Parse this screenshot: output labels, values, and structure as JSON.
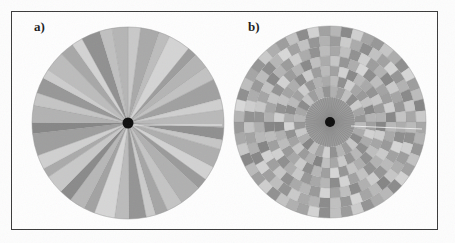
{
  "figure": {
    "background_color": "#fdfdfd",
    "frame_color": "#3a3a3a",
    "width": 455,
    "height": 243
  },
  "panels": [
    {
      "id": "panel-a",
      "label": "a)",
      "label_x": 34,
      "label_y": 19,
      "center_x": 128,
      "center_y": 123,
      "radius": 96,
      "hub_radius": 5.5,
      "hub_color": "#0d0d0d"
    },
    {
      "id": "panel-b",
      "label": "b)",
      "label_x": 248,
      "label_y": 19,
      "center_x": 330,
      "center_y": 122,
      "radius": 96,
      "hub_radius": 5,
      "hub_color": "#0d0d0d",
      "inner_disc_radius": 25,
      "inner_disc_color": "#9b9b9b",
      "inner_spoke_color": "#7d7d7d",
      "inner_spoke_count": 64
    }
  ],
  "palette": {
    "lightest": "#d8d8d8",
    "light": "#c6c6c6",
    "mid_light": "#b6b6b6",
    "mid": "#a8a8a8",
    "mid_dark": "#9a9a9a",
    "dark": "#8d8d8d",
    "darkest": "#7f7f7f",
    "separator": "#8a8a8a",
    "white_streak": "#f2f2f2"
  },
  "chart_data": {
    "type": "pie",
    "title": "",
    "subtitle": "",
    "xlabel": "",
    "ylabel": "",
    "legend": [],
    "grid": false,
    "panel_a": {
      "type": "pie",
      "description": "Unsupervised radial partition: full disc divided into 40 angular sectors of unequal width, each filled with a grayscale value.",
      "sector_count": 40,
      "start_angle_deg": -90,
      "categories": [
        "s1",
        "s2",
        "s3",
        "s4",
        "s5",
        "s6",
        "s7",
        "s8",
        "s9",
        "s10",
        "s11",
        "s12",
        "s13",
        "s14",
        "s15",
        "s16",
        "s17",
        "s18",
        "s19",
        "s20",
        "s21",
        "s22",
        "s23",
        "s24",
        "s25",
        "s26",
        "s27",
        "s28",
        "s29",
        "s30",
        "s31",
        "s32",
        "s33",
        "s34",
        "s35",
        "s36",
        "s37",
        "s38",
        "s39",
        "s40"
      ],
      "values": [
        8,
        12,
        7,
        14,
        6,
        10,
        9,
        13,
        7,
        11,
        8,
        6,
        12,
        9,
        7,
        14,
        10,
        8,
        6,
        11,
        9,
        13,
        7,
        10,
        8,
        12,
        6,
        9,
        14,
        7,
        11,
        8,
        10,
        6,
        13,
        9,
        7,
        12,
        8,
        10
      ],
      "colors": [
        "#c9c9c9",
        "#a9a9a9",
        "#bdbdbd",
        "#d4d4d4",
        "#9d9d9d",
        "#b4b4b4",
        "#c2c2c2",
        "#a0a0a0",
        "#cfcfcf",
        "#b9b9b9",
        "#8f8f8f",
        "#c6c6c6",
        "#aeaeae",
        "#d2d2d2",
        "#9a9a9a",
        "#b0b0b0",
        "#c4c4c4",
        "#a5a5a5",
        "#cbcbcb",
        "#949494",
        "#bbbbbb",
        "#d6d6d6",
        "#a2a2a2",
        "#b7b7b7",
        "#8a8a8a",
        "#c8c8c8",
        "#aaaaaa",
        "#d0d0d0",
        "#9e9e9e",
        "#868686",
        "#b2b2b2",
        "#c5c5c5",
        "#979797",
        "#cdcdcd",
        "#bcbcbc",
        "#a7a7a7",
        "#d3d3d3",
        "#909090",
        "#c0c0c0",
        "#b5b5b5"
      ]
    },
    "panel_b": {
      "type": "heatmap",
      "description": "Polar heatmap: dark uniform inner disc of fine radial spokes surrounded by 7 concentric rings, each ring divided into angular cells with grayscale fills.",
      "ring_count": 7,
      "ring_radii": [
        25,
        36,
        46,
        56,
        66,
        76,
        86,
        96
      ],
      "sectors_per_ring": [
        28,
        32,
        36,
        40,
        44,
        48,
        52
      ],
      "start_angle_deg": -90,
      "ring_values": [
        [
          0.52,
          0.61,
          0.44,
          0.7,
          0.38,
          0.58,
          0.66,
          0.47,
          0.55,
          0.72,
          0.41,
          0.63,
          0.5,
          0.68,
          0.36,
          0.59,
          0.45,
          0.74,
          0.53,
          0.4,
          0.65,
          0.49,
          0.57,
          0.71,
          0.43,
          0.62,
          0.51,
          0.67
        ],
        [
          0.46,
          0.69,
          0.37,
          0.58,
          0.64,
          0.42,
          0.73,
          0.5,
          0.61,
          0.35,
          0.55,
          0.7,
          0.48,
          0.66,
          0.39,
          0.57,
          0.44,
          0.75,
          0.52,
          0.63,
          0.41,
          0.59,
          0.68,
          0.34,
          0.54,
          0.71,
          0.47,
          0.6,
          0.38,
          0.65,
          0.51,
          0.56
        ],
        [
          0.6,
          0.35,
          0.72,
          0.48,
          0.56,
          0.67,
          0.4,
          0.63,
          0.51,
          0.74,
          0.37,
          0.58,
          0.45,
          0.69,
          0.53,
          0.42,
          0.66,
          0.33,
          0.61,
          0.49,
          0.7,
          0.39,
          0.57,
          0.64,
          0.46,
          0.52,
          0.75,
          0.36,
          0.68,
          0.43,
          0.59,
          0.54,
          0.71,
          0.38,
          0.62,
          0.47
        ],
        [
          0.41,
          0.66,
          0.54,
          0.33,
          0.7,
          0.45,
          0.59,
          0.62,
          0.37,
          0.73,
          0.48,
          0.56,
          0.64,
          0.39,
          0.51,
          0.68,
          0.43,
          0.6,
          0.34,
          0.71,
          0.49,
          0.57,
          0.65,
          0.4,
          0.53,
          0.69,
          0.36,
          0.61,
          0.46,
          0.74,
          0.52,
          0.58,
          0.42,
          0.67,
          0.35,
          0.63,
          0.5,
          0.72,
          0.44,
          0.55
        ],
        [
          0.57,
          0.44,
          0.68,
          0.36,
          0.62,
          0.51,
          0.73,
          0.39,
          0.58,
          0.65,
          0.42,
          0.54,
          0.7,
          0.33,
          0.6,
          0.47,
          0.66,
          0.38,
          0.52,
          0.71,
          0.45,
          0.59,
          0.34,
          0.64,
          0.49,
          0.56,
          0.69,
          0.41,
          0.61,
          0.35,
          0.74,
          0.48,
          0.53,
          0.67,
          0.4,
          0.58,
          0.43,
          0.72,
          0.5,
          0.63,
          0.37,
          0.55,
          0.68,
          0.46
        ],
        [
          0.63,
          0.38,
          0.55,
          0.7,
          0.43,
          0.6,
          0.34,
          0.66,
          0.51,
          0.72,
          0.4,
          0.57,
          0.47,
          0.69,
          0.36,
          0.62,
          0.53,
          0.41,
          0.74,
          0.48,
          0.58,
          0.33,
          0.65,
          0.44,
          0.71,
          0.5,
          0.56,
          0.39,
          0.67,
          0.45,
          0.61,
          0.35,
          0.73,
          0.52,
          0.59,
          0.42,
          0.68,
          0.37,
          0.54,
          0.64,
          0.46,
          0.7,
          0.49,
          0.32,
          0.6,
          0.43,
          0.66,
          0.51
        ],
        [
          0.49,
          0.72,
          0.36,
          0.58,
          0.65,
          0.41,
          0.54,
          0.69,
          0.33,
          0.62,
          0.46,
          0.74,
          0.39,
          0.57,
          0.51,
          0.66,
          0.43,
          0.6,
          0.35,
          0.71,
          0.48,
          0.55,
          0.67,
          0.38,
          0.63,
          0.44,
          0.7,
          0.34,
          0.59,
          0.52,
          0.42,
          0.68,
          0.37,
          0.61,
          0.47,
          0.73,
          0.4,
          0.56,
          0.64,
          0.5,
          0.32,
          0.69,
          0.45,
          0.58,
          0.66,
          0.39,
          0.53,
          0.62,
          0.43,
          0.71,
          0.35,
          0.6
        ]
      ],
      "value_to_color_range": [
        "#dcdcdc",
        "#7d7d7d"
      ],
      "zlim": [
        0.3,
        0.78
      ]
    }
  }
}
